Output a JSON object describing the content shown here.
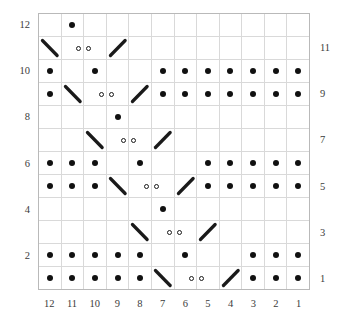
{
  "chart_data": {
    "type": "table",
    "title": "",
    "xlabel": "",
    "ylabel": "",
    "grid": true,
    "legend_position": "none",
    "columns": 12,
    "rows": 12,
    "column_labels": [
      "12",
      "11",
      "10",
      "9",
      "8",
      "7",
      "6",
      "5",
      "4",
      "3",
      "2",
      "1"
    ],
    "row_labels_left": [
      "12",
      "10",
      "8",
      "6",
      "4",
      "2"
    ],
    "row_labels_right": [
      "11",
      "9",
      "7",
      "5",
      "3",
      "1"
    ],
    "symbol_legend": {
      "dot": "purl-stitch-dot",
      "ring": "yarn-over-open-circle",
      "slash": "right-leaning-decrease",
      "bslash": "left-leaning-decrease",
      "blank": "knit-stitch-empty"
    },
    "colors": {
      "symbol": "#1a1a1a",
      "gridline": "#d9d9d9",
      "frame": "#b9b9b9",
      "background": "#ffffff",
      "label": "#3b3b3b"
    },
    "cells": [
      {
        "row": 12,
        "values": [
          "",
          "dot",
          "",
          "",
          "",
          "",
          "",
          "",
          "",
          "",
          "",
          ""
        ]
      },
      {
        "row": 11,
        "values": [
          "bslash",
          "ring-l",
          "ring-r",
          "slash",
          "",
          "",
          "",
          "",
          "",
          "",
          "",
          ""
        ]
      },
      {
        "row": 10,
        "values": [
          "dot",
          "",
          "dot",
          "",
          "",
          "dot",
          "dot",
          "dot",
          "dot",
          "dot",
          "dot",
          "dot"
        ]
      },
      {
        "row": 9,
        "values": [
          "dot",
          "bslash",
          "ring-l",
          "ring-r",
          "slash",
          "dot",
          "dot",
          "dot",
          "dot",
          "dot",
          "dot",
          "dot"
        ]
      },
      {
        "row": 8,
        "values": [
          "",
          "",
          "",
          "dot",
          "",
          "",
          "",
          "",
          "",
          "",
          "",
          ""
        ]
      },
      {
        "row": 7,
        "values": [
          "",
          "",
          "bslash",
          "ring-l",
          "ring-r",
          "slash",
          "",
          "",
          "",
          "",
          "",
          ""
        ]
      },
      {
        "row": 6,
        "values": [
          "dot",
          "dot",
          "dot",
          "",
          "dot",
          "",
          "",
          "dot",
          "dot",
          "dot",
          "dot",
          "dot"
        ]
      },
      {
        "row": 5,
        "values": [
          "dot",
          "dot",
          "dot",
          "bslash",
          "ring-l",
          "ring-r",
          "slash",
          "dot",
          "dot",
          "dot",
          "dot",
          "dot"
        ]
      },
      {
        "row": 4,
        "values": [
          "",
          "",
          "",
          "",
          "",
          "dot",
          "",
          "",
          "",
          "",
          "",
          ""
        ]
      },
      {
        "row": 3,
        "values": [
          "",
          "",
          "",
          "",
          "bslash",
          "ring-l",
          "ring-r",
          "slash",
          "",
          "",
          "",
          ""
        ]
      },
      {
        "row": 2,
        "values": [
          "dot",
          "dot",
          "dot",
          "dot",
          "dot",
          "",
          "dot",
          "",
          "",
          "dot",
          "dot",
          "dot"
        ]
      },
      {
        "row": 1,
        "values": [
          "dot",
          "dot",
          "dot",
          "dot",
          "dot",
          "bslash",
          "ring-l",
          "ring-r",
          "slash",
          "dot",
          "dot",
          "dot"
        ]
      }
    ]
  }
}
